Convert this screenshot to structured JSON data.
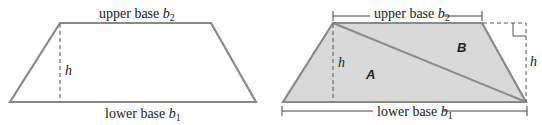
{
  "colors": {
    "outline": "#8a8a8a",
    "fill_shaded": "#d9d9d9",
    "dash": "#555555",
    "text": "#222222"
  },
  "left_figure": {
    "upper_label": "upper base ",
    "upper_var": "b",
    "upper_sub": "2",
    "lower_label": "lower base ",
    "lower_var": "b",
    "lower_sub": "1",
    "height_label": "h"
  },
  "right_figure": {
    "upper_label": "upper base ",
    "upper_var": "b",
    "upper_sub": "2",
    "lower_label": "lower base ",
    "lower_var": "b",
    "lower_sub": "1",
    "height_label_left": "h",
    "height_label_right": "h",
    "region_a": "A",
    "region_b": "B"
  }
}
